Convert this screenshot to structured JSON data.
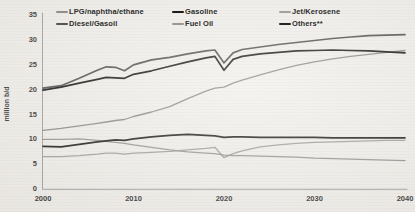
{
  "colors": {
    "paper": "#f2f0ec",
    "axis": "#9a9a9a",
    "tick_text": "#3a3a3a",
    "legend_text": "#2e2e2e"
  },
  "chart_data": {
    "type": "line",
    "title": "",
    "ylabel": "million b/d",
    "xlabel": "",
    "grid": false,
    "legend_position": "top",
    "xlim": [
      2000,
      2040
    ],
    "ylim": [
      0,
      35
    ],
    "yticks": [
      0,
      5,
      10,
      15,
      20,
      25,
      30,
      35
    ],
    "xticks": [
      2000,
      2010,
      2020,
      2030,
      2040
    ],
    "x": [
      2000,
      2002,
      2004,
      2006,
      2007,
      2008,
      2009,
      2010,
      2012,
      2014,
      2016,
      2018,
      2019,
      2020,
      2021,
      2022,
      2024,
      2026,
      2028,
      2030,
      2032,
      2034,
      2036,
      2038,
      2040
    ],
    "series": [
      {
        "name": "LPG/naphtha/ethane",
        "color": "#8f8f8f",
        "width": 1.3,
        "values": [
          11.7,
          12.1,
          12.6,
          13.1,
          13.4,
          13.7,
          13.9,
          14.5,
          15.4,
          16.5,
          18.1,
          19.6,
          20.2,
          20.4,
          21.2,
          21.8,
          22.9,
          23.9,
          24.8,
          25.5,
          26.1,
          26.6,
          27.0,
          27.4,
          27.8
        ]
      },
      {
        "name": "Gasoline",
        "color": "#1c1c1c",
        "width": 1.7,
        "values": [
          19.8,
          20.4,
          21.2,
          22.0,
          22.4,
          22.3,
          22.2,
          23.0,
          23.7,
          24.6,
          25.5,
          26.3,
          26.6,
          23.8,
          26.0,
          26.6,
          27.1,
          27.4,
          27.7,
          27.8,
          27.9,
          27.8,
          27.7,
          27.5,
          27.3
        ]
      },
      {
        "name": "Jet/Kerosene",
        "color": "#a3a3a3",
        "width": 1.3,
        "values": [
          6.4,
          6.4,
          6.6,
          6.9,
          7.1,
          7.1,
          6.9,
          7.1,
          7.3,
          7.5,
          7.8,
          8.1,
          8.3,
          6.2,
          7.0,
          7.6,
          8.4,
          8.8,
          9.1,
          9.3,
          9.4,
          9.5,
          9.6,
          9.7,
          9.7
        ]
      },
      {
        "name": "Diesel/Gasoil",
        "color": "#555555",
        "width": 1.7,
        "values": [
          20.2,
          20.7,
          22.2,
          23.8,
          24.5,
          24.4,
          23.7,
          24.9,
          25.9,
          26.4,
          27.1,
          27.7,
          27.9,
          25.3,
          27.3,
          28.0,
          28.5,
          29.0,
          29.4,
          29.8,
          30.2,
          30.5,
          30.8,
          30.9,
          31.0
        ]
      },
      {
        "name": "Fuel Oil",
        "color": "#999999",
        "width": 1.3,
        "values": [
          9.9,
          9.9,
          10.0,
          9.7,
          9.5,
          9.3,
          9.1,
          8.8,
          8.3,
          7.8,
          7.4,
          7.1,
          7.0,
          6.7,
          6.6,
          6.6,
          6.5,
          6.4,
          6.3,
          6.1,
          6.0,
          5.9,
          5.8,
          5.7,
          5.6
        ]
      },
      {
        "name": "Others**",
        "color": "#262626",
        "width": 1.7,
        "values": [
          8.5,
          8.4,
          8.9,
          9.4,
          9.6,
          9.8,
          9.7,
          10.0,
          10.4,
          10.7,
          10.9,
          10.7,
          10.6,
          10.3,
          10.4,
          10.4,
          10.3,
          10.3,
          10.3,
          10.3,
          10.2,
          10.2,
          10.2,
          10.2,
          10.2
        ]
      }
    ]
  }
}
